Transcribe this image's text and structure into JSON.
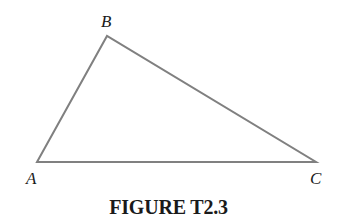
{
  "figure": {
    "caption": "FIGURE T2.3",
    "shape": "triangle",
    "stroke_color": "#808080",
    "vertices": [
      {
        "label": "A",
        "x": 37,
        "y": 162
      },
      {
        "label": "B",
        "x": 107,
        "y": 36
      },
      {
        "label": "C",
        "x": 316,
        "y": 162
      }
    ],
    "labels": {
      "A": "A",
      "B": "B",
      "C": "C"
    }
  }
}
